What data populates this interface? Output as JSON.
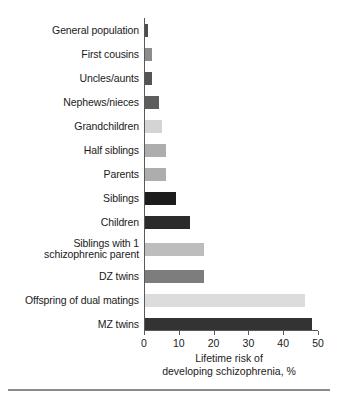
{
  "chart_data": {
    "type": "bar",
    "orientation": "horizontal",
    "title": "",
    "xlabel": "Lifetime risk of developing schizophrenia, %",
    "ylabel": "",
    "xlim": [
      0,
      50
    ],
    "xticks": [
      0,
      10,
      20,
      30,
      40,
      50
    ],
    "grid": false,
    "legend": "none",
    "categories": [
      "General population",
      "First cousins",
      "Uncles/aunts",
      "Nephews/nieces",
      "Grandchildren",
      "Half siblings",
      "Parents",
      "Siblings",
      "Children",
      "Siblings with 1\nschizophrenic parent",
      "DZ twins",
      "Offspring of dual matings",
      "MZ twins"
    ],
    "values": [
      1,
      2,
      2,
      4,
      5,
      6,
      6,
      9,
      13,
      17,
      17,
      46,
      48
    ],
    "colors": [
      "#4d4d4d",
      "#8c8c8c",
      "#545454",
      "#5e5e5e",
      "#d4d4d4",
      "#adadad",
      "#adadad",
      "#1c1c1c",
      "#2b2b2b",
      "#bdbdbd",
      "#7d7d7d",
      "#dcdcdc",
      "#333333"
    ]
  },
  "axis": {
    "title_line1": "Lifetime risk of",
    "title_line2": "developing schizophrenia, %"
  }
}
